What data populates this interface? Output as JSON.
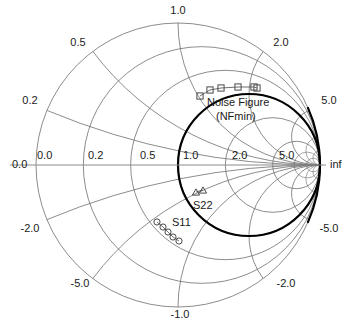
{
  "figure": {
    "type": "smith-chart",
    "title": "",
    "background": "#ffffff",
    "grid_color": "#6e6e6e",
    "axis_color": "#8c8c8c",
    "bold_circle_color": "#000000",
    "marker_color": "#4a4a4a"
  },
  "chart_data": {
    "type": "scatter",
    "title": "",
    "xlabel": "",
    "ylabel": "",
    "chart_kind": "smith-chart",
    "center_px": [
      178,
      165
    ],
    "radius_px": 142,
    "resistance_circles": [
      0.0,
      0.2,
      0.5,
      1.0,
      2.0,
      5.0
    ],
    "reactance_arcs": [
      0.2,
      0.5,
      1.0,
      2.0,
      5.0,
      -0.2,
      -0.5,
      -1.0,
      -2.0,
      -5.0
    ],
    "emphasized_circle": {
      "r": 1.0,
      "label": "unit resistance circle",
      "linewidth": 2.2
    },
    "axis_tick_labels": {
      "real_axis": [
        "0.0",
        "0.2",
        "0.5",
        "1.0",
        "2.0",
        "5.0",
        "inf"
      ],
      "outer_left": "0.0",
      "outer_upper": [
        "0.2",
        "0.5",
        "1.0",
        "2.0",
        "5.0"
      ],
      "outer_lower": [
        "-0.2",
        "-0.5",
        "-1.0",
        "-2.0",
        "-5.0"
      ]
    },
    "series": [
      {
        "name": "Noise Figure (NFmin)",
        "marker": "square",
        "label": "Noise Figure\n(NFmin)",
        "label_line1": "Noise Figure",
        "label_line2": "(NFmin)",
        "points_px": [
          [
            200,
            96
          ],
          [
            210,
            90
          ],
          [
            221,
            88
          ],
          [
            238,
            87
          ],
          [
            254,
            87
          ],
          [
            257,
            88
          ]
        ],
        "n_points": 6
      },
      {
        "name": "S22",
        "marker": "triangle",
        "label": "S22",
        "points_px": [
          [
            196,
            192
          ],
          [
            203,
            190
          ]
        ],
        "n_points": 2
      },
      {
        "name": "S11",
        "marker": "circle",
        "label": "S11",
        "points_px": [
          [
            157,
            222
          ],
          [
            163,
            227
          ],
          [
            168,
            232
          ],
          [
            173,
            237
          ],
          [
            179,
            241
          ]
        ],
        "n_points": 5
      }
    ],
    "legend_position": "inline-annotations",
    "grid": true
  },
  "labels": {
    "real_axis": [
      {
        "text": "0.0",
        "x": 12,
        "y": 168,
        "anchor": "start"
      },
      {
        "text": "0.0",
        "x": 37,
        "y": 159,
        "anchor": "start"
      },
      {
        "text": "0.2",
        "x": 88,
        "y": 159,
        "anchor": "start"
      },
      {
        "text": "0.5",
        "x": 140,
        "y": 159,
        "anchor": "start"
      },
      {
        "text": "1.0",
        "x": 183,
        "y": 159,
        "anchor": "start"
      },
      {
        "text": "2.0",
        "x": 232,
        "y": 159,
        "anchor": "start"
      },
      {
        "text": "5.0",
        "x": 279,
        "y": 159,
        "anchor": "start"
      },
      {
        "text": "inf",
        "x": 330,
        "y": 168,
        "anchor": "start"
      }
    ],
    "outer": [
      {
        "text": "1.0",
        "x": 178,
        "y": 14,
        "anchor": "middle"
      },
      {
        "text": "0.5",
        "x": 78,
        "y": 46,
        "anchor": "middle"
      },
      {
        "text": "2.0",
        "x": 281,
        "y": 46,
        "anchor": "middle"
      },
      {
        "text": "0.2",
        "x": 30,
        "y": 104,
        "anchor": "middle"
      },
      {
        "text": "5.0",
        "x": 329,
        "y": 104,
        "anchor": "middle"
      },
      {
        "text": "-2.0",
        "x": 30,
        "y": 232,
        "anchor": "middle"
      },
      {
        "text": "-5.0",
        "x": 329,
        "y": 232,
        "anchor": "middle"
      },
      {
        "text": "-5.0",
        "x": 80,
        "y": 287,
        "anchor": "middle"
      },
      {
        "text": "-2.0",
        "x": 286,
        "y": 287,
        "anchor": "middle"
      },
      {
        "text": "-1.0",
        "x": 180,
        "y": 318,
        "anchor": "middle"
      }
    ],
    "annotations": [
      {
        "name": "nf-label-line1",
        "text": "Noise Figure",
        "x": 207,
        "y": 106,
        "anchor": "start"
      },
      {
        "name": "nf-label-line2",
        "text": "(NFmin)",
        "x": 216,
        "y": 120,
        "anchor": "start"
      },
      {
        "name": "s22-label",
        "text": "S22",
        "x": 193,
        "y": 209,
        "anchor": "start"
      },
      {
        "name": "s11-label",
        "text": "S11",
        "x": 172,
        "y": 226,
        "anchor": "start"
      }
    ]
  }
}
